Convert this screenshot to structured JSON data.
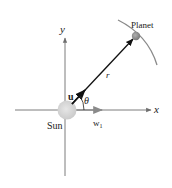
{
  "diagram": {
    "labels": {
      "y_axis": "y",
      "x_axis": "x",
      "planet": "Planet",
      "sun": "Sun",
      "r": "r",
      "u": "u",
      "theta": "θ",
      "w1": "w",
      "w1_sub": "1"
    },
    "colors": {
      "axis": "#6e6e6e",
      "vector": "#111111",
      "sun": "#d6d6d6",
      "planet": "#8c8c8c",
      "orbit": "#8a8a8a"
    }
  }
}
